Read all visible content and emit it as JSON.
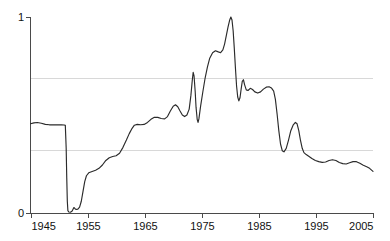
{
  "chart_data": {
    "type": "line",
    "title": "",
    "subtitle": "",
    "xlabel": "",
    "ylabel": "",
    "xlim": [
      1945,
      2005
    ],
    "ylim": [
      0,
      1
    ],
    "grid": true,
    "gridlines_y": [
      0.32,
      0.69
    ],
    "legend": "none",
    "x_ticks": [
      1945,
      1955,
      1965,
      1975,
      1985,
      1995,
      2005
    ],
    "x_tick_labels": [
      "1945",
      "1955",
      "1965",
      "1975",
      "1985",
      "1995",
      "2005"
    ],
    "y_ticks": [
      0,
      1
    ],
    "y_tick_labels": [
      "0",
      "1"
    ],
    "series": [
      {
        "name": "series-1",
        "color": "#2b2b2b",
        "points": [
          [
            1945.0,
            0.455
          ],
          [
            1945.6,
            0.46
          ],
          [
            1946.2,
            0.462
          ],
          [
            1946.9,
            0.458
          ],
          [
            1947.6,
            0.452
          ],
          [
            1948.3,
            0.45
          ],
          [
            1949.0,
            0.45
          ],
          [
            1949.8,
            0.45
          ],
          [
            1950.4,
            0.45
          ],
          [
            1950.9,
            0.449
          ],
          [
            1951.1,
            0.447
          ],
          [
            1951.25,
            0.33
          ],
          [
            1951.35,
            0.18
          ],
          [
            1951.45,
            0.06
          ],
          [
            1951.55,
            0.012
          ],
          [
            1951.7,
            0.005
          ],
          [
            1952.0,
            0.004
          ],
          [
            1952.3,
            0.01
          ],
          [
            1952.6,
            0.028
          ],
          [
            1952.8,
            0.022
          ],
          [
            1953.0,
            0.018
          ],
          [
            1953.3,
            0.02
          ],
          [
            1953.6,
            0.03
          ],
          [
            1953.9,
            0.06
          ],
          [
            1954.2,
            0.11
          ],
          [
            1954.5,
            0.16
          ],
          [
            1954.8,
            0.19
          ],
          [
            1955.2,
            0.205
          ],
          [
            1955.8,
            0.212
          ],
          [
            1956.4,
            0.218
          ],
          [
            1957.0,
            0.228
          ],
          [
            1957.6,
            0.245
          ],
          [
            1958.2,
            0.268
          ],
          [
            1958.8,
            0.282
          ],
          [
            1959.4,
            0.288
          ],
          [
            1960.0,
            0.292
          ],
          [
            1960.6,
            0.305
          ],
          [
            1961.2,
            0.335
          ],
          [
            1961.8,
            0.372
          ],
          [
            1962.3,
            0.405
          ],
          [
            1962.8,
            0.432
          ],
          [
            1963.2,
            0.448
          ],
          [
            1963.7,
            0.452
          ],
          [
            1964.3,
            0.45
          ],
          [
            1964.9,
            0.452
          ],
          [
            1965.5,
            0.462
          ],
          [
            1966.1,
            0.478
          ],
          [
            1966.7,
            0.488
          ],
          [
            1967.3,
            0.488
          ],
          [
            1967.9,
            0.482
          ],
          [
            1968.5,
            0.48
          ],
          [
            1969.0,
            0.492
          ],
          [
            1969.5,
            0.52
          ],
          [
            1970.0,
            0.545
          ],
          [
            1970.4,
            0.552
          ],
          [
            1970.8,
            0.542
          ],
          [
            1971.2,
            0.52
          ],
          [
            1971.6,
            0.5
          ],
          [
            1972.0,
            0.492
          ],
          [
            1972.4,
            0.5
          ],
          [
            1972.8,
            0.53
          ],
          [
            1973.1,
            0.6
          ],
          [
            1973.35,
            0.68
          ],
          [
            1973.5,
            0.718
          ],
          [
            1973.65,
            0.7
          ],
          [
            1973.85,
            0.62
          ],
          [
            1974.0,
            0.54
          ],
          [
            1974.2,
            0.478
          ],
          [
            1974.35,
            0.462
          ],
          [
            1974.5,
            0.48
          ],
          [
            1974.8,
            0.545
          ],
          [
            1975.2,
            0.62
          ],
          [
            1975.6,
            0.69
          ],
          [
            1976.0,
            0.745
          ],
          [
            1976.4,
            0.79
          ],
          [
            1976.9,
            0.818
          ],
          [
            1977.4,
            0.828
          ],
          [
            1977.9,
            0.822
          ],
          [
            1978.3,
            0.818
          ],
          [
            1978.7,
            0.832
          ],
          [
            1979.0,
            0.862
          ],
          [
            1979.3,
            0.905
          ],
          [
            1979.6,
            0.948
          ],
          [
            1979.9,
            0.985
          ],
          [
            1980.1,
            1.0
          ],
          [
            1980.3,
            0.985
          ],
          [
            1980.5,
            0.93
          ],
          [
            1980.7,
            0.84
          ],
          [
            1980.9,
            0.74
          ],
          [
            1981.1,
            0.648
          ],
          [
            1981.3,
            0.592
          ],
          [
            1981.5,
            0.572
          ],
          [
            1981.7,
            0.588
          ],
          [
            1981.9,
            0.632
          ],
          [
            1982.1,
            0.672
          ],
          [
            1982.3,
            0.68
          ],
          [
            1982.5,
            0.655
          ],
          [
            1982.8,
            0.628
          ],
          [
            1983.1,
            0.625
          ],
          [
            1983.5,
            0.636
          ],
          [
            1983.9,
            0.63
          ],
          [
            1984.3,
            0.618
          ],
          [
            1984.8,
            0.612
          ],
          [
            1985.3,
            0.618
          ],
          [
            1985.8,
            0.632
          ],
          [
            1986.3,
            0.642
          ],
          [
            1986.8,
            0.644
          ],
          [
            1987.2,
            0.638
          ],
          [
            1987.6,
            0.622
          ],
          [
            1987.9,
            0.58
          ],
          [
            1988.2,
            0.505
          ],
          [
            1988.5,
            0.42
          ],
          [
            1988.8,
            0.352
          ],
          [
            1989.1,
            0.318
          ],
          [
            1989.4,
            0.312
          ],
          [
            1989.8,
            0.33
          ],
          [
            1990.2,
            0.372
          ],
          [
            1990.6,
            0.42
          ],
          [
            1991.0,
            0.448
          ],
          [
            1991.4,
            0.462
          ],
          [
            1991.7,
            0.455
          ],
          [
            1992.0,
            0.42
          ],
          [
            1992.3,
            0.37
          ],
          [
            1992.6,
            0.33
          ],
          [
            1992.9,
            0.308
          ],
          [
            1993.3,
            0.298
          ],
          [
            1993.8,
            0.288
          ],
          [
            1994.3,
            0.278
          ],
          [
            1994.9,
            0.268
          ],
          [
            1995.5,
            0.262
          ],
          [
            1996.1,
            0.258
          ],
          [
            1996.7,
            0.26
          ],
          [
            1997.3,
            0.268
          ],
          [
            1997.9,
            0.272
          ],
          [
            1998.5,
            0.268
          ],
          [
            1999.1,
            0.258
          ],
          [
            1999.7,
            0.252
          ],
          [
            2000.3,
            0.25
          ],
          [
            2000.9,
            0.256
          ],
          [
            2001.5,
            0.262
          ],
          [
            2002.1,
            0.262
          ],
          [
            2002.7,
            0.254
          ],
          [
            2003.3,
            0.244
          ],
          [
            2003.9,
            0.236
          ],
          [
            2004.4,
            0.228
          ],
          [
            2005.0,
            0.212
          ]
        ]
      }
    ]
  },
  "axes": {
    "y_top_label": "1",
    "y_bottom_label": "0"
  },
  "colors": {
    "line": "#2b2b2b",
    "axis": "#4a4a4a",
    "grid": "#d8d8d8",
    "background": "#ffffff",
    "text": "#111111"
  }
}
